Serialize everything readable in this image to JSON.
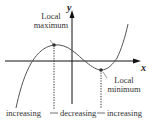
{
  "diagram": {
    "axes": {
      "x_label": "x",
      "y_label": "y"
    },
    "annotations": {
      "max_line1": "Local",
      "max_line2": "maximum",
      "min_line1": "Local",
      "min_line2": "minimum"
    },
    "intervals": [
      {
        "label": "increasing"
      },
      {
        "label": "decreasing"
      },
      {
        "label": "increasing"
      }
    ],
    "colors": {
      "curve": "#555555",
      "axis": "#111111",
      "point": "#333333"
    }
  }
}
